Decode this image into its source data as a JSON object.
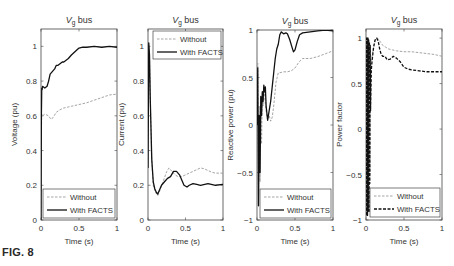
{
  "figure": {
    "label": "FIG. 8"
  },
  "colors": {
    "with": "#111111",
    "without": "#9a9a9a",
    "frame": "#444444",
    "text": "#333333"
  },
  "chart_data": [
    {
      "type": "line",
      "title": "V_g bus",
      "title_main": "V",
      "title_sub": "g",
      "title_rest": " bus",
      "xlabel": "Time (s)",
      "ylabel": "Voltage (pu)",
      "xlim": [
        0,
        1
      ],
      "ylim": [
        0,
        1.1
      ],
      "xticks": [
        0,
        0.5,
        1
      ],
      "xtick_labels": [
        "0",
        "0.5",
        "1"
      ],
      "yticks": [
        0,
        0.2,
        0.4,
        0.6,
        0.8,
        1
      ],
      "ytick_labels": [
        "0",
        "0.2",
        "0.4",
        "0.6",
        "0.8",
        "1"
      ],
      "frame": {
        "x": 41,
        "y": 29,
        "w": 76,
        "h": 191
      },
      "legend": {
        "position": "lower",
        "box": {
          "x": 43,
          "y": 189,
          "w": 72,
          "h": 29
        },
        "entries": [
          "Without",
          "With FACTS"
        ],
        "with_dashed": false
      },
      "series": [
        {
          "name": "Without",
          "style": "dashed",
          "x": [
            0,
            0.005,
            0.01,
            0.02,
            0.05,
            0.1,
            0.13,
            0.16,
            0.2,
            0.25,
            0.3,
            0.35,
            0.4,
            0.5,
            0.6,
            0.7,
            0.8,
            0.9,
            1.0
          ],
          "y": [
            0,
            0.5,
            0.61,
            0.6,
            0.61,
            0.6,
            0.58,
            0.59,
            0.62,
            0.635,
            0.645,
            0.65,
            0.655,
            0.665,
            0.675,
            0.69,
            0.705,
            0.72,
            0.725
          ]
        },
        {
          "name": "With FACTS",
          "style": "solid",
          "x": [
            0,
            0.005,
            0.01,
            0.015,
            0.02,
            0.05,
            0.08,
            0.1,
            0.12,
            0.14,
            0.16,
            0.18,
            0.2,
            0.22,
            0.25,
            0.28,
            0.3,
            0.33,
            0.36,
            0.4,
            0.45,
            0.5,
            0.55,
            0.6,
            0.7,
            0.8,
            0.9,
            1.0
          ],
          "y": [
            0,
            0.6,
            0.76,
            0.75,
            0.77,
            0.76,
            0.77,
            0.8,
            0.84,
            0.85,
            0.86,
            0.87,
            0.89,
            0.89,
            0.9,
            0.91,
            0.91,
            0.92,
            0.93,
            0.95,
            0.97,
            0.99,
            0.995,
            0.995,
            1.0,
            0.995,
            1.0,
            0.995
          ]
        }
      ]
    },
    {
      "type": "line",
      "title": "V_g bus",
      "title_main": "V",
      "title_sub": "g",
      "title_rest": " bus",
      "xlabel": "Time (s)",
      "ylabel": "Current (pu)",
      "xlim": [
        0,
        1
      ],
      "ylim": [
        0,
        1.1
      ],
      "xticks": [
        0,
        0.5,
        1
      ],
      "xtick_labels": [
        "0",
        "0.5",
        "1"
      ],
      "yticks": [
        0,
        0.2,
        0.4,
        0.6,
        0.8,
        1
      ],
      "ytick_labels": [
        "0",
        "0.2",
        "0.4",
        "0.6",
        "0.8",
        "1"
      ],
      "frame": {
        "x": 148,
        "y": 29,
        "w": 75,
        "h": 191
      },
      "legend": {
        "position": "upper",
        "box": {
          "x": 153,
          "y": 31,
          "w": 68,
          "h": 28
        },
        "entries": [
          "Without",
          "With FACTS"
        ],
        "with_dashed": false
      },
      "series": [
        {
          "name": "Without",
          "style": "dashed",
          "x": [
            0,
            0.01,
            0.02,
            0.03,
            0.05,
            0.07,
            0.1,
            0.13,
            0.16,
            0.2,
            0.25,
            0.28,
            0.32,
            0.36,
            0.4,
            0.45,
            0.5,
            0.55,
            0.6,
            0.65,
            0.7,
            0.75,
            0.8,
            0.85,
            0.9,
            0.95,
            1.0
          ],
          "y": [
            0.3,
            1.0,
            0.95,
            0.7,
            0.35,
            0.2,
            0.16,
            0.14,
            0.17,
            0.22,
            0.28,
            0.3,
            0.28,
            0.26,
            0.25,
            0.25,
            0.26,
            0.27,
            0.28,
            0.29,
            0.3,
            0.295,
            0.285,
            0.275,
            0.27,
            0.27,
            0.27
          ]
        },
        {
          "name": "With FACTS",
          "style": "solid",
          "x": [
            0,
            0.01,
            0.02,
            0.03,
            0.05,
            0.07,
            0.09,
            0.11,
            0.13,
            0.15,
            0.18,
            0.22,
            0.26,
            0.3,
            0.34,
            0.38,
            0.42,
            0.45,
            0.48,
            0.52,
            0.55,
            0.6,
            0.65,
            0.7,
            0.8,
            0.9,
            1.0
          ],
          "y": [
            0.3,
            1.02,
            0.95,
            0.7,
            0.35,
            0.22,
            0.18,
            0.16,
            0.15,
            0.17,
            0.2,
            0.22,
            0.24,
            0.25,
            0.28,
            0.28,
            0.26,
            0.23,
            0.2,
            0.19,
            0.2,
            0.21,
            0.205,
            0.2,
            0.21,
            0.2,
            0.205
          ]
        }
      ]
    },
    {
      "type": "line",
      "title": "V_g bus",
      "title_main": "V",
      "title_sub": "g",
      "title_rest": " bus",
      "xlabel": "Time (s)",
      "ylabel": "Reactive power (pu)",
      "xlim": [
        0,
        1
      ],
      "ylim": [
        -1,
        1
      ],
      "xticks": [
        0,
        0.5,
        1
      ],
      "xtick_labels": [
        "0",
        "0.5",
        "1"
      ],
      "yticks": [
        -1,
        -0.5,
        0,
        0.5,
        1
      ],
      "ytick_labels": [
        "−1",
        "−0.5",
        "0",
        "0.5",
        "1"
      ],
      "frame": {
        "x": 257,
        "y": 30,
        "w": 76,
        "h": 190
      },
      "legend": {
        "position": "lower",
        "box": {
          "x": 260,
          "y": 189,
          "w": 71,
          "h": 29
        },
        "entries": [
          "Without",
          "With FACTS"
        ],
        "with_dashed": false
      },
      "series": [
        {
          "name": "Without",
          "style": "dashed",
          "x": [
            0,
            0.01,
            0.02,
            0.03,
            0.04,
            0.05,
            0.06,
            0.07,
            0.08,
            0.09,
            0.1,
            0.12,
            0.14,
            0.16,
            0.18,
            0.2,
            0.22,
            0.25,
            0.28,
            0.3,
            0.35,
            0.4,
            0.45,
            0.5,
            0.55,
            0.6,
            0.7,
            0.8,
            0.9,
            1.0
          ],
          "y": [
            0,
            0.65,
            -0.8,
            0.2,
            -0.6,
            0.3,
            -0.2,
            0.35,
            0.2,
            0.4,
            0.3,
            0.15,
            0.05,
            0.1,
            0.04,
            0.08,
            0.2,
            0.45,
            0.55,
            0.55,
            0.56,
            0.56,
            0.57,
            0.6,
            0.66,
            0.7,
            0.7,
            0.72,
            0.75,
            0.78
          ]
        },
        {
          "name": "With FACTS",
          "style": "solid",
          "x": [
            0,
            0.01,
            0.02,
            0.03,
            0.04,
            0.05,
            0.06,
            0.07,
            0.08,
            0.09,
            0.1,
            0.11,
            0.12,
            0.14,
            0.16,
            0.18,
            0.2,
            0.22,
            0.24,
            0.26,
            0.28,
            0.3,
            0.32,
            0.35,
            0.38,
            0.4,
            0.43,
            0.46,
            0.48,
            0.5,
            0.53,
            0.56,
            0.6,
            0.7,
            0.8,
            0.9,
            1.0
          ],
          "y": [
            0,
            0.6,
            -0.85,
            0.1,
            -0.5,
            0.3,
            0.1,
            0.35,
            0.25,
            0.42,
            0.35,
            0.4,
            0.2,
            0.05,
            0.15,
            0.25,
            0.4,
            0.55,
            0.7,
            0.8,
            0.85,
            0.95,
            0.98,
            0.96,
            0.97,
            0.96,
            0.9,
            0.82,
            0.77,
            0.79,
            0.88,
            0.95,
            0.97,
            0.98,
            0.99,
            1.0,
            0.99
          ]
        }
      ]
    },
    {
      "type": "line",
      "title": "V_g bus",
      "title_main": "V",
      "title_sub": "g",
      "title_rest": " bus",
      "xlabel": "Time (s)",
      "ylabel": "Power factor",
      "xlim": [
        0,
        1
      ],
      "ylim": [
        -1,
        1.1
      ],
      "xticks": [
        0,
        0.5,
        1
      ],
      "xtick_labels": [
        "0",
        "0.5",
        "1"
      ],
      "yticks": [
        -1,
        -0.5,
        0,
        0.5,
        1
      ],
      "ytick_labels": [
        "−1",
        "−0.5",
        "0",
        "0.5",
        "1"
      ],
      "frame": {
        "x": 366,
        "y": 29,
        "w": 76,
        "h": 191
      },
      "legend": {
        "position": "lower",
        "box": {
          "x": 370,
          "y": 188,
          "w": 70,
          "h": 29
        },
        "entries": [
          "Without",
          "With FACTS"
        ],
        "with_dashed": true
      },
      "series": [
        {
          "name": "Without",
          "style": "dashed",
          "x": [
            0,
            0.005,
            0.01,
            0.015,
            0.02,
            0.025,
            0.03,
            0.035,
            0.04,
            0.045,
            0.05,
            0.055,
            0.06,
            0.07,
            0.08,
            0.1,
            0.12,
            0.15,
            0.18,
            0.22,
            0.26,
            0.3,
            0.35,
            0.4,
            0.5,
            0.6,
            0.7,
            0.8,
            0.9,
            1.0
          ],
          "y": [
            -0.95,
            1.0,
            -0.95,
            1.0,
            -0.95,
            1.0,
            -0.9,
            0.98,
            -0.9,
            0.95,
            -0.5,
            0.9,
            0.3,
            0.7,
            0.8,
            0.9,
            0.98,
            1.0,
            0.97,
            0.92,
            0.9,
            0.88,
            0.87,
            0.86,
            0.85,
            0.85,
            0.84,
            0.83,
            0.82,
            0.8
          ]
        },
        {
          "name": "With FACTS",
          "style": "dashed-bold",
          "x": [
            0,
            0.005,
            0.01,
            0.015,
            0.02,
            0.025,
            0.03,
            0.035,
            0.04,
            0.045,
            0.05,
            0.055,
            0.06,
            0.07,
            0.08,
            0.1,
            0.12,
            0.14,
            0.16,
            0.18,
            0.2,
            0.22,
            0.25,
            0.28,
            0.32,
            0.36,
            0.4,
            0.45,
            0.5,
            0.55,
            0.6,
            0.7,
            0.8,
            0.9,
            1.0
          ],
          "y": [
            -0.95,
            1.0,
            -0.95,
            1.0,
            -0.95,
            1.0,
            -0.9,
            0.98,
            -0.92,
            0.96,
            -0.6,
            0.92,
            0.2,
            0.65,
            0.75,
            0.9,
            0.98,
            1.0,
            0.97,
            0.88,
            0.82,
            0.8,
            0.8,
            0.76,
            0.77,
            0.8,
            0.78,
            0.74,
            0.68,
            0.66,
            0.65,
            0.64,
            0.63,
            0.63,
            0.63
          ]
        }
      ]
    }
  ]
}
